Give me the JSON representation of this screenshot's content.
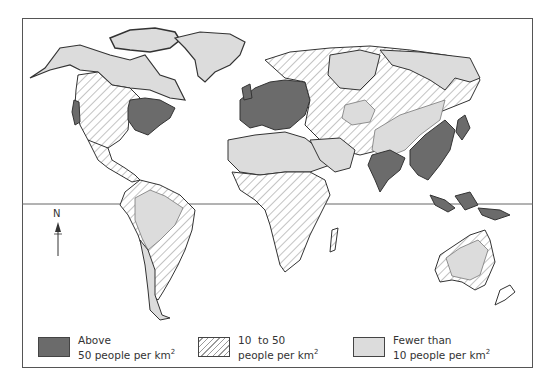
{
  "map": {
    "type": "choropleth",
    "title": "World population density",
    "features": {
      "equator_line": true,
      "north_arrow_label": "N"
    },
    "colors": {
      "high": "#6b6b6b",
      "medium_hatch_line": "#9a9a9a",
      "low": "#dcdcdc",
      "outline": "#333333"
    }
  },
  "legend": {
    "items": [
      {
        "line1": "Above",
        "line2": "50 people per km",
        "sup": "2",
        "pattern": "solid-dark"
      },
      {
        "line1": "10  to 50",
        "line2": "people per km",
        "sup": "2",
        "pattern": "hatched"
      },
      {
        "line1": "Fewer than",
        "line2": "10 people per km",
        "sup": "2",
        "pattern": "solid-light"
      }
    ]
  }
}
